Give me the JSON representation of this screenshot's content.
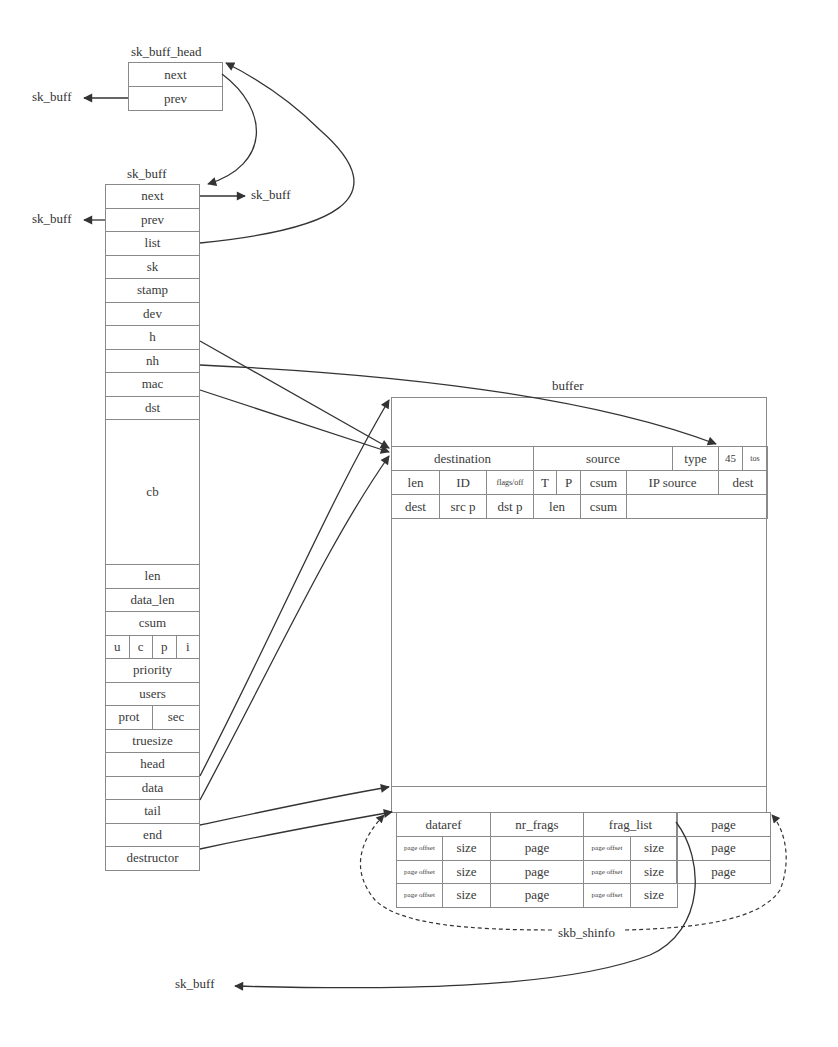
{
  "diagram": {
    "type": "sk_buff memory layout",
    "labels": {
      "sk_buff_head_title": "sk_buff_head",
      "sk_buff_title": "sk_buff",
      "buffer_title": "buffer",
      "skb_shinfo": "skb_shinfo",
      "ext_prev_head": "sk_buff",
      "ext_next": "sk_buff",
      "ext_prev": "sk_buff",
      "ext_frag_list": "sk_buff"
    },
    "sk_buff_head": {
      "fields": [
        "next",
        "prev"
      ]
    },
    "sk_buff": {
      "fields": {
        "next": "next",
        "prev": "prev",
        "list": "list",
        "sk": "sk",
        "stamp": "stamp",
        "dev": "dev",
        "h": "h",
        "nh": "nh",
        "mac": "mac",
        "dst": "dst",
        "cb": "cb",
        "len": "len",
        "data_len": "data_len",
        "csum": "csum",
        "u": "u",
        "c": "c",
        "p": "p",
        "i": "i",
        "priority": "priority",
        "users": "users",
        "prot": "prot",
        "sec": "sec",
        "truesize": "truesize",
        "head": "head",
        "data": "data",
        "tail": "tail",
        "end": "end",
        "destructor": "destructor"
      }
    },
    "buffer": {
      "eth": {
        "destination": "destination",
        "source": "source",
        "type": "type",
        "ver_ihl": "45",
        "tos": "tos"
      },
      "ip": {
        "len": "len",
        "id": "ID",
        "flags_off": "flags/off",
        "ttl": "T",
        "proto": "P",
        "csum": "csum",
        "ip_source": "IP source",
        "dest": "dest"
      },
      "udp": {
        "dest": "dest",
        "src_port": "src p",
        "dst_port": "dst p",
        "len": "len",
        "csum": "csum"
      }
    },
    "shinfo": {
      "header": {
        "dataref": "dataref",
        "nr_frags": "nr_frags",
        "frag_list": "frag_list",
        "page": "page"
      },
      "page_offset": "page offset",
      "size": "size",
      "page": "page"
    }
  },
  "colors": {
    "line": "#333333",
    "border": "#8a8a8a",
    "text": "#3a3a3a"
  }
}
